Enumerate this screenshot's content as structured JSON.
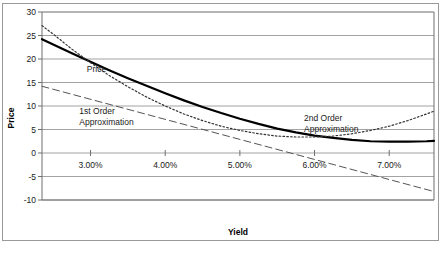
{
  "chart_data": {
    "type": "line",
    "title": "",
    "xlabel": "Yield",
    "ylabel": "Price",
    "xlim": [
      0.0235,
      0.076
    ],
    "ylim": [
      -10,
      30
    ],
    "xticks": [
      "3.00%",
      "4.00%",
      "5.00%",
      "6.00%",
      "7.00%"
    ],
    "xtick_values": [
      0.03,
      0.04,
      0.05,
      0.06,
      0.07
    ],
    "yticks": [
      "30",
      "25",
      "20",
      "15",
      "10",
      "5",
      "0",
      "-5",
      "-10"
    ],
    "ytick_values": [
      30,
      25,
      20,
      15,
      10,
      5,
      0,
      -5,
      -10
    ],
    "grid": "horizontal",
    "legend_position": "inline-annotations",
    "series": [
      {
        "name": "Price",
        "style": "solid",
        "color": "#000000",
        "width": 2.2,
        "label": "Price",
        "label_x": 0.0295,
        "label_y": 17.2,
        "x": [
          0.0235,
          0.025,
          0.0275,
          0.03,
          0.0325,
          0.035,
          0.0375,
          0.04,
          0.0425,
          0.045,
          0.0475,
          0.05,
          0.0525,
          0.055,
          0.0575,
          0.06,
          0.0625,
          0.065,
          0.0675,
          0.07,
          0.0725,
          0.075,
          0.076
        ],
        "y": [
          24.2,
          23.1,
          21.2,
          19.4,
          17.6,
          15.9,
          14.3,
          12.7,
          11.2,
          9.8,
          8.5,
          7.3,
          6.2,
          5.2,
          4.4,
          3.7,
          3.2,
          2.8,
          2.5,
          2.4,
          2.4,
          2.5,
          2.6
        ]
      },
      {
        "name": "1st Order Approximation",
        "style": "dashed",
        "color": "#555555",
        "width": 1.0,
        "label": "1st Order\nApproximation",
        "label_line1": "1st Order",
        "label_line2": "Approximation",
        "label_x": 0.0285,
        "label_y": 8.4,
        "x": [
          0.0235,
          0.076
        ],
        "y": [
          14.2,
          -8.2
        ]
      },
      {
        "name": "2nd Order Approximation",
        "style": "dotted",
        "color": "#333333",
        "width": 1.2,
        "label": "2nd Order\nApproximation",
        "label_line1": "2nd Order",
        "label_line2": "Approximation",
        "label_x": 0.0586,
        "label_y": 6.9,
        "x": [
          0.0235,
          0.025,
          0.0275,
          0.03,
          0.0325,
          0.035,
          0.0375,
          0.04,
          0.0425,
          0.045,
          0.0475,
          0.05,
          0.0525,
          0.055,
          0.0575,
          0.06,
          0.0625,
          0.065,
          0.0675,
          0.07,
          0.0725,
          0.075,
          0.076
        ],
        "y": [
          27.1,
          25.3,
          22.1,
          19.2,
          16.5,
          14.1,
          11.9,
          10.0,
          8.3,
          6.9,
          5.7,
          4.8,
          4.1,
          3.6,
          3.4,
          3.4,
          3.6,
          4.1,
          4.8,
          5.7,
          6.9,
          8.3,
          8.9
        ]
      }
    ]
  },
  "axes": {
    "x_title": "Yield",
    "y_title": "Price"
  }
}
